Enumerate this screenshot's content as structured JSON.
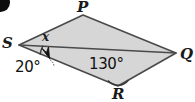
{
  "figure": {
    "type": "geometry-diagram",
    "shape": "quadrilateral",
    "fill_color": "#d6d6d6",
    "stroke_color": "#4a4a4a",
    "background_color": "#ffffff",
    "vertices": [
      {
        "name": "P",
        "label": "P",
        "x": 83,
        "y": 15
      },
      {
        "name": "Q",
        "label": "Q",
        "x": 176,
        "y": 53
      },
      {
        "name": "R",
        "label": "R",
        "x": 118,
        "y": 86
      },
      {
        "name": "S",
        "label": "S",
        "x": 19,
        "y": 45
      }
    ],
    "diagonal": {
      "from": "S",
      "to": "Q"
    },
    "angles": [
      {
        "name": "angle-x-at-S",
        "label": "x",
        "vertex": "S",
        "between": [
          "SP",
          "SQ"
        ]
      },
      {
        "name": "angle-20-at-S",
        "label": "20°",
        "vertex": "S",
        "between": [
          "SQ",
          "SR"
        ]
      },
      {
        "name": "angle-130-at-R",
        "label": "130°",
        "vertex": "R",
        "between": [
          "RS",
          "RQ"
        ]
      }
    ],
    "pointer": {
      "name": "leader-arrow",
      "from_label": "20°",
      "to_vertex": "S"
    },
    "corner_marker": {
      "name": "corner-bullet",
      "color": "#0d0d0d"
    }
  }
}
